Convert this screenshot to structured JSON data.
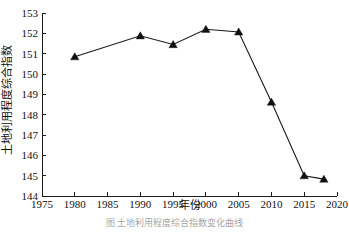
{
  "figure": {
    "caption_partial": "图         土地利用程度综合指数变化曲线"
  },
  "chart_data": {
    "type": "line",
    "title": "",
    "xlabel": "年份",
    "ylabel": "土地利用程度综合指数",
    "xlim": [
      1975,
      2020
    ],
    "ylim": [
      144,
      153
    ],
    "xticks": [
      1975,
      1980,
      1985,
      1990,
      1995,
      2000,
      2005,
      2010,
      2015,
      2020
    ],
    "yticks": [
      144,
      145,
      146,
      147,
      148,
      149,
      150,
      151,
      152,
      153
    ],
    "grid": false,
    "legend": false,
    "marker": "triangle",
    "line_color": "#1a1a1a",
    "marker_color": "#111111",
    "x": [
      1980,
      1990,
      1995,
      2000,
      2005,
      2010,
      2015,
      2018
    ],
    "values": [
      150.85,
      151.88,
      151.45,
      152.2,
      152.07,
      148.62,
      145.0,
      144.83
    ],
    "series": [
      {
        "name": "土地利用程度综合指数",
        "x": [
          1980,
          1990,
          1995,
          2000,
          2005,
          2010,
          2015,
          2018
        ],
        "values": [
          150.85,
          151.88,
          151.45,
          152.2,
          152.07,
          148.62,
          145.0,
          144.83
        ]
      }
    ]
  }
}
